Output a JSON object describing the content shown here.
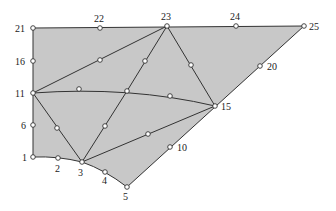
{
  "diagram": {
    "type": "finite-element-mesh",
    "fill_color": "#c8c8c8",
    "line_color": "#333333",
    "nodes": [
      {
        "id": "1",
        "x": 33,
        "y": 157,
        "label": "1",
        "lx": 22,
        "ly": 161
      },
      {
        "id": "2",
        "x": 58,
        "y": 158,
        "label": "2",
        "lx": 55,
        "ly": 172
      },
      {
        "id": "3",
        "x": 82,
        "y": 162,
        "label": "3",
        "lx": 78,
        "ly": 176
      },
      {
        "id": "4",
        "x": 105,
        "y": 172,
        "label": "4",
        "lx": 102,
        "ly": 184
      },
      {
        "id": "5",
        "x": 127,
        "y": 187,
        "label": "5",
        "lx": 123,
        "ly": 200
      },
      {
        "id": "6",
        "x": 33,
        "y": 125,
        "label": "6",
        "lx": 21,
        "ly": 129
      },
      {
        "id": "11",
        "x": 33,
        "y": 93,
        "label": "11",
        "lx": 15,
        "ly": 97
      },
      {
        "id": "16",
        "x": 33,
        "y": 61,
        "label": "16",
        "lx": 15,
        "ly": 65
      },
      {
        "id": "21",
        "x": 33,
        "y": 28,
        "label": "21",
        "lx": 15,
        "ly": 32
      },
      {
        "id": "22",
        "x": 100,
        "y": 28,
        "label": "22",
        "lx": 94,
        "ly": 22
      },
      {
        "id": "23",
        "x": 167,
        "y": 26,
        "label": "23",
        "lx": 161,
        "ly": 20
      },
      {
        "id": "24",
        "x": 236,
        "y": 26,
        "label": "24",
        "lx": 230,
        "ly": 20
      },
      {
        "id": "25",
        "x": 304,
        "y": 26,
        "label": "25",
        "lx": 309,
        "ly": 30
      },
      {
        "id": "20",
        "x": 260,
        "y": 66,
        "label": "20",
        "lx": 267,
        "ly": 70
      },
      {
        "id": "15",
        "x": 215,
        "y": 106,
        "label": "15",
        "lx": 221,
        "ly": 110
      },
      {
        "id": "10",
        "x": 170,
        "y": 147,
        "label": "10",
        "lx": 177,
        "ly": 151
      },
      {
        "id": "m1",
        "x": 100,
        "y": 60,
        "label": ""
      },
      {
        "id": "m2",
        "x": 145,
        "y": 61,
        "label": ""
      },
      {
        "id": "m3",
        "x": 191,
        "y": 65,
        "label": ""
      },
      {
        "id": "m4",
        "x": 79,
        "y": 89,
        "label": ""
      },
      {
        "id": "13",
        "x": 127,
        "y": 91,
        "label": ""
      },
      {
        "id": "m5",
        "x": 170,
        "y": 96,
        "label": ""
      },
      {
        "id": "m6",
        "x": 57,
        "y": 128,
        "label": ""
      },
      {
        "id": "m7",
        "x": 105,
        "y": 126,
        "label": ""
      },
      {
        "id": "m8",
        "x": 148,
        "y": 134,
        "label": ""
      }
    ],
    "edges": [
      "M33,28 L304,26",
      "M304,26 L127,187",
      "M33,28 L33,157",
      "M33,157 Q58,156 82,162 Q105,170 127,187",
      "M33,93 L167,26",
      "M167,26 L127,91 L82,162",
      "M167,26 L215,106",
      "M33,93 Q130,86 215,106",
      "M33,93 L82,162",
      "M82,162 L215,106"
    ],
    "outline": "M33,28 L304,26 L127,187 Q105,170 82,162 Q58,156 33,157 Z"
  }
}
